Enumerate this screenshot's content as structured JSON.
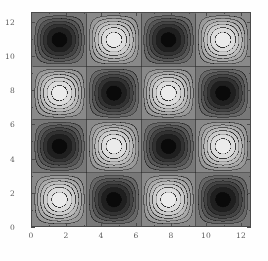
{
  "chart_data": {
    "type": "heatmap",
    "title": "",
    "subtitle": "",
    "xlabel": "",
    "ylabel": "",
    "xlim": [
      0,
      12.566
    ],
    "ylim": [
      0,
      12.566
    ],
    "grid": false,
    "legend": null,
    "colormap": "grayscale",
    "colormap_low": "#000000",
    "colormap_high": "#f2f2f2",
    "frame_color": "#4a4a4a",
    "background_color": "#ffffff",
    "function": "sin(x) * sin(y)",
    "period_x": 3.1416,
    "period_y": 3.1416,
    "zlim": [
      -1,
      1
    ],
    "contour_levels": [
      -0.9,
      -0.75,
      -0.6,
      -0.45,
      -0.3,
      -0.15,
      0,
      0.15,
      0.3,
      0.45,
      0.6,
      0.75,
      0.9
    ],
    "n_contours": 13,
    "contour_line_color": "#2a2a2a",
    "xticks": [
      0,
      2,
      4,
      6,
      8,
      10,
      12
    ],
    "yticks": [
      0,
      2,
      4,
      6,
      8,
      10,
      12
    ],
    "xtick_labels": [
      "0",
      "2",
      "4",
      "6",
      "8",
      "10",
      "12"
    ],
    "ytick_labels": [
      "0",
      "2",
      "4",
      "6",
      "8",
      "10",
      "12"
    ],
    "x_minor_ticks": [
      1,
      3,
      5,
      7,
      9,
      11
    ],
    "y_minor_ticks": [
      1,
      3,
      5,
      7,
      9,
      11
    ],
    "maxima_centers": [
      [
        1.571,
        1.571
      ],
      [
        1.571,
        7.854
      ],
      [
        4.712,
        4.712
      ],
      [
        4.712,
        10.996
      ],
      [
        7.854,
        1.571
      ],
      [
        7.854,
        7.854
      ],
      [
        10.996,
        4.712
      ],
      [
        10.996,
        10.996
      ]
    ],
    "minima_centers": [
      [
        1.571,
        4.712
      ],
      [
        1.571,
        10.996
      ],
      [
        4.712,
        1.571
      ],
      [
        4.712,
        7.854
      ],
      [
        7.854,
        4.712
      ],
      [
        7.854,
        10.996
      ],
      [
        10.996,
        1.571
      ],
      [
        10.996,
        7.854
      ]
    ],
    "sample_values": {
      "max": 1.0,
      "min": -1.0,
      "saddle": 0.0
    }
  }
}
